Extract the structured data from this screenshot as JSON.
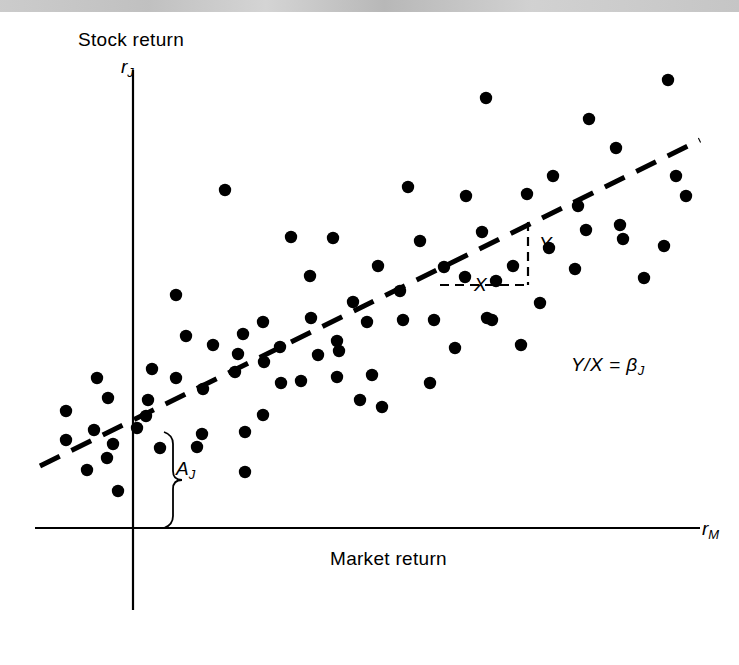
{
  "figure": {
    "title_axis_y": "Stock return",
    "title_axis_x": "Market return",
    "y_axis_symbol": "r",
    "y_axis_subscript": "J",
    "x_axis_symbol": "r",
    "x_axis_subscript": "M",
    "slope_rise_label": "Y",
    "slope_run_label": "X",
    "intercept_label": "A",
    "intercept_subscript": "J",
    "equation_text": "Y/X = ",
    "equation_beta": "β",
    "equation_beta_subscript": "J",
    "ink_color": "#000000",
    "background_color": "#ffffff",
    "scan_band_color": "#c4c4c4"
  },
  "chart_data": {
    "type": "scatter",
    "title": "",
    "xlabel": "Market return",
    "ylabel": "Stock return",
    "x_axis_symbol": "r_M",
    "y_axis_symbol": "r_J",
    "grid": false,
    "legend": "none",
    "axis_origin_px": {
      "x": 133,
      "y": 528
    },
    "xlim_px": [
      35,
      700
    ],
    "ylim_px": [
      70,
      520
    ],
    "annotations": [
      {
        "name": "regression-line",
        "type": "dashed-line",
        "x1": 40,
        "y1": 466,
        "x2": 700,
        "y2": 140,
        "style": "dashed",
        "thickness": 5
      },
      {
        "name": "slope-triangle-rise",
        "label": "Y",
        "type": "dashed-segment",
        "x1": 528,
        "y1": 222,
        "x2": 528,
        "y2": 285
      },
      {
        "name": "slope-triangle-run",
        "label": "X",
        "type": "dashed-segment",
        "x1": 440,
        "y1": 285,
        "x2": 528,
        "y2": 285
      },
      {
        "name": "intercept-brace",
        "label": "A_J",
        "type": "brace",
        "x": 164,
        "y_top": 432,
        "y_bottom": 528
      },
      {
        "name": "beta-equation",
        "text": "Y/X = β_J",
        "x": 571,
        "y": 355
      }
    ],
    "points_px": [
      [
        668,
        80
      ],
      [
        486,
        98
      ],
      [
        589,
        119
      ],
      [
        616,
        148
      ],
      [
        676,
        176
      ],
      [
        686,
        196
      ],
      [
        553,
        176
      ],
      [
        578,
        206
      ],
      [
        225,
        190
      ],
      [
        408,
        187
      ],
      [
        466,
        196
      ],
      [
        333,
        238
      ],
      [
        420,
        241
      ],
      [
        527,
        194
      ],
      [
        586,
        230
      ],
      [
        482,
        232
      ],
      [
        620,
        225
      ],
      [
        549,
        248
      ],
      [
        291,
        237
      ],
      [
        465,
        277
      ],
      [
        496,
        281
      ],
      [
        444,
        267
      ],
      [
        378,
        266
      ],
      [
        513,
        266
      ],
      [
        310,
        276
      ],
      [
        176,
        295
      ],
      [
        400,
        291
      ],
      [
        664,
        246
      ],
      [
        644,
        278
      ],
      [
        353,
        302
      ],
      [
        311,
        318
      ],
      [
        367,
        322
      ],
      [
        263,
        322
      ],
      [
        403,
        320
      ],
      [
        487,
        318
      ],
      [
        186,
        336
      ],
      [
        243,
        334
      ],
      [
        280,
        347
      ],
      [
        337,
        341
      ],
      [
        434,
        320
      ],
      [
        492,
        320
      ],
      [
        152,
        369
      ],
      [
        97,
        378
      ],
      [
        176,
        378
      ],
      [
        213,
        345
      ],
      [
        235,
        372
      ],
      [
        318,
        355
      ],
      [
        372,
        375
      ],
      [
        238,
        354
      ],
      [
        264,
        362
      ],
      [
        148,
        400
      ],
      [
        203,
        389
      ],
      [
        301,
        381
      ],
      [
        66,
        411
      ],
      [
        108,
        398
      ],
      [
        146,
        416
      ],
      [
        281,
        383
      ],
      [
        339,
        351
      ],
      [
        455,
        348
      ],
      [
        521,
        345
      ],
      [
        202,
        434
      ],
      [
        94,
        430
      ],
      [
        137,
        428
      ],
      [
        66,
        440
      ],
      [
        107,
        458
      ],
      [
        87,
        470
      ],
      [
        118,
        491
      ],
      [
        160,
        448
      ],
      [
        197,
        447
      ],
      [
        245,
        432
      ],
      [
        245,
        472
      ],
      [
        263,
        415
      ],
      [
        360,
        400
      ],
      [
        382,
        407
      ],
      [
        430,
        383
      ],
      [
        623,
        239
      ],
      [
        540,
        303
      ],
      [
        575,
        269
      ],
      [
        337,
        377
      ],
      [
        113,
        444
      ]
    ]
  }
}
